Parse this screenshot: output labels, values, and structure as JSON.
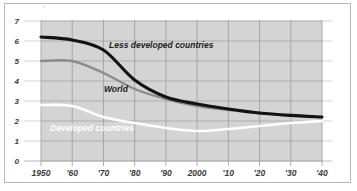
{
  "chart_data": {
    "type": "line",
    "title": "",
    "subtitle": "",
    "xlabel": "",
    "ylabel": "",
    "grid": true,
    "legend_position": "inline-labels",
    "xlim": [
      1950,
      2040
    ],
    "ylim": [
      0,
      7
    ],
    "x": [
      1950,
      1960,
      1970,
      1980,
      1990,
      2000,
      2010,
      2020,
      2030,
      2040
    ],
    "categories": [
      "1950",
      "'60",
      "'70",
      "'80",
      "'90",
      "2000",
      "'10",
      "'20",
      "'30",
      "'40"
    ],
    "ytick_labels": [
      "0",
      "1",
      "2",
      "3",
      "4",
      "5",
      "6",
      "7"
    ],
    "ytick_values": [
      0,
      1,
      2,
      3,
      4,
      5,
      6,
      7
    ],
    "series": [
      {
        "name": "Less developed countries",
        "color": "#121212",
        "values": [
          6.2,
          6.05,
          5.55,
          4.05,
          3.2,
          2.85,
          2.6,
          2.4,
          2.28,
          2.2
        ]
      },
      {
        "name": "World",
        "color": "#8c8c8c",
        "values": [
          5.0,
          5.0,
          4.4,
          3.6,
          3.1,
          2.75,
          2.55,
          2.38,
          2.27,
          2.2
        ]
      },
      {
        "name": "Developed countries",
        "color": "#ffffff",
        "values": [
          2.8,
          2.75,
          2.2,
          1.9,
          1.65,
          1.5,
          1.6,
          1.75,
          1.9,
          2.0
        ]
      }
    ],
    "plot_background": "#d4d4d4",
    "gridline_color": "#9a9a9a",
    "axis_color": "#b5b5b5"
  },
  "annotations": {
    "less_developed": "Less developed countries",
    "world": "World",
    "developed": "Developed countries"
  },
  "top_artifact": "+"
}
